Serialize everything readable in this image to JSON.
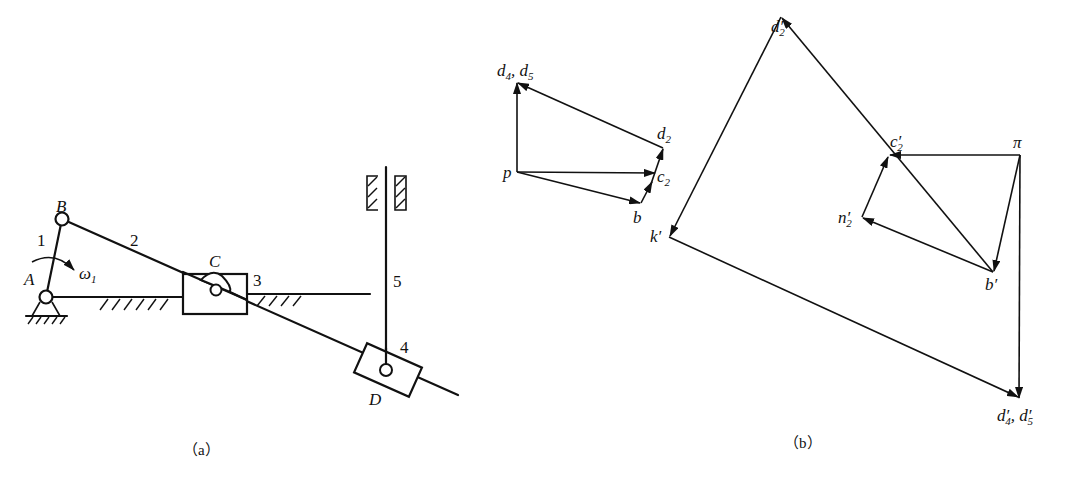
{
  "figure_a": {
    "caption": "（a）",
    "labels": {
      "A": "A",
      "B": "B",
      "C": "C",
      "D": "D",
      "link1": "1",
      "link2": "2",
      "link3": "3",
      "link4": "4",
      "link5": "5",
      "omega": "ω",
      "omega_sub": "1"
    }
  },
  "figure_b": {
    "caption": "（b）",
    "velocity_polygon": {
      "pole": "p",
      "points": {
        "d45_a": "d",
        "d45_a_sub": "4",
        "d45_b": "d",
        "d45_b_sub": "5",
        "d2": "d",
        "d2_sub": "2",
        "c2": "c",
        "c2_sub": "2",
        "b": "b"
      }
    },
    "acceleration_polygon": {
      "pole": "π",
      "points": {
        "d2p": "d′",
        "d2p_sub": "2",
        "c2p": "c′",
        "c2p_sub": "2",
        "n2p": "n′",
        "n2p_sub": "2",
        "bp": "b′",
        "kp": "k′",
        "d45p_a": "d′",
        "d45p_a_sub": "4",
        "d45p_b": "d′",
        "d45p_b_sub": "5"
      }
    }
  }
}
